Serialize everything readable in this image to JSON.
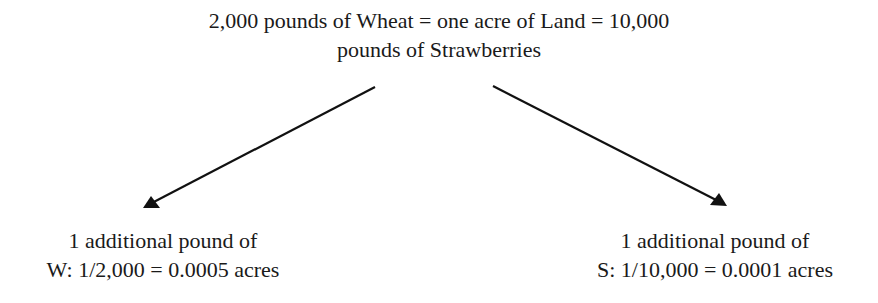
{
  "diagram": {
    "top_node": {
      "line1": "2,000 pounds of Wheat = one acre of Land = 10,000",
      "line2": "pounds of Strawberries"
    },
    "left_node": {
      "line1": "1 additional pound of",
      "line2": "W: 1/2,000 = 0.0005 acres"
    },
    "right_node": {
      "line1": "1 additional pound of",
      "line2": "S: 1/10,000 = 0.0001 acres"
    },
    "edges": [
      {
        "from": "top_node",
        "to": "left_node",
        "style": "arrow"
      },
      {
        "from": "top_node",
        "to": "right_node",
        "style": "arrow"
      }
    ],
    "colors": {
      "text": "#1a1a1a",
      "arrow": "#111111",
      "background": "#ffffff"
    }
  }
}
